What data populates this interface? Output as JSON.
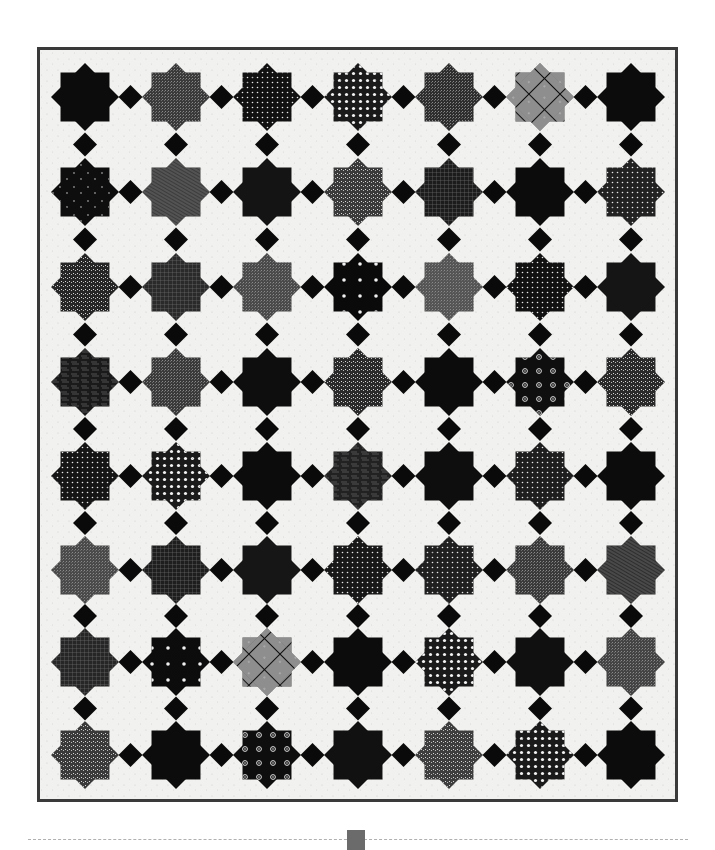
{
  "page": {
    "page_number_tab": ""
  },
  "quilt": {
    "columns": 7,
    "rows": 8,
    "background_color": "#f1f1ef",
    "border_color": "#3a3a3a",
    "connector_color": "#0a0a0a",
    "col_centers": [
      85,
      176,
      267,
      358,
      449,
      540,
      631
    ],
    "row_centers": [
      97,
      192,
      287,
      382,
      476,
      570,
      662,
      755
    ],
    "star_size": 68,
    "stars": [
      [
        {
          "tone": "#0c0c0c",
          "pattern": "solid"
        },
        {
          "tone": "#3a3a3a",
          "pattern": "texture"
        },
        {
          "tone": "#111111",
          "pattern": "dots"
        },
        {
          "tone": "#1a1a1a",
          "pattern": "flowers-light"
        },
        {
          "tone": "#2e2e2e",
          "pattern": "texture"
        },
        {
          "tone": "#7a7a7a",
          "pattern": "plaid"
        },
        {
          "tone": "#0c0c0c",
          "pattern": "solid"
        }
      ],
      [
        {
          "tone": "#0e0e0e",
          "pattern": "stars-sparse"
        },
        {
          "tone": "#3c3c3c",
          "pattern": "lines"
        },
        {
          "tone": "#141414",
          "pattern": "solid"
        },
        {
          "tone": "#3a3a3a",
          "pattern": "speckle"
        },
        {
          "tone": "#1c1c1c",
          "pattern": "grid"
        },
        {
          "tone": "#0c0c0c",
          "pattern": "solid"
        },
        {
          "tone": "#222222",
          "pattern": "dots"
        }
      ],
      [
        {
          "tone": "#262626",
          "pattern": "speckle"
        },
        {
          "tone": "#2a2a2a",
          "pattern": "grid"
        },
        {
          "tone": "#4a4a4a",
          "pattern": "texture"
        },
        {
          "tone": "#0a0a0a",
          "pattern": "dots-large"
        },
        {
          "tone": "#555555",
          "pattern": "texture"
        },
        {
          "tone": "#111111",
          "pattern": "dots"
        },
        {
          "tone": "#151515",
          "pattern": "solid"
        }
      ],
      [
        {
          "tone": "#1a1a1a",
          "pattern": "print"
        },
        {
          "tone": "#3a3a3a",
          "pattern": "texture"
        },
        {
          "tone": "#0e0e0e",
          "pattern": "solid"
        },
        {
          "tone": "#2a2a2a",
          "pattern": "speckle"
        },
        {
          "tone": "#0c0c0c",
          "pattern": "solid"
        },
        {
          "tone": "#0f0f0f",
          "pattern": "flowers"
        },
        {
          "tone": "#2a2a2a",
          "pattern": "speckle"
        }
      ],
      [
        {
          "tone": "#151515",
          "pattern": "dots"
        },
        {
          "tone": "#1a1a1a",
          "pattern": "flowers-light"
        },
        {
          "tone": "#0c0c0c",
          "pattern": "solid"
        },
        {
          "tone": "#222222",
          "pattern": "print"
        },
        {
          "tone": "#0e0e0e",
          "pattern": "solid"
        },
        {
          "tone": "#1e1e1e",
          "pattern": "dots"
        },
        {
          "tone": "#0c0c0c",
          "pattern": "solid"
        }
      ],
      [
        {
          "tone": "#4a4a4a",
          "pattern": "texture"
        },
        {
          "tone": "#1e1e1e",
          "pattern": "grid"
        },
        {
          "tone": "#161616",
          "pattern": "solid"
        },
        {
          "tone": "#181818",
          "pattern": "dots"
        },
        {
          "tone": "#202020",
          "pattern": "dots"
        },
        {
          "tone": "#3a3a3a",
          "pattern": "texture"
        },
        {
          "tone": "#2e2e2e",
          "pattern": "lines"
        }
      ],
      [
        {
          "tone": "#262626",
          "pattern": "grid"
        },
        {
          "tone": "#0c0c0c",
          "pattern": "dots-large"
        },
        {
          "tone": "#6a6a6a",
          "pattern": "plaid"
        },
        {
          "tone": "#0c0c0c",
          "pattern": "solid"
        },
        {
          "tone": "#1a1a1a",
          "pattern": "flowers-light"
        },
        {
          "tone": "#101010",
          "pattern": "solid"
        },
        {
          "tone": "#444444",
          "pattern": "texture"
        }
      ],
      [
        {
          "tone": "#3a3a3a",
          "pattern": "speckle"
        },
        {
          "tone": "#0c0c0c",
          "pattern": "solid"
        },
        {
          "tone": "#0e0e0e",
          "pattern": "flowers"
        },
        {
          "tone": "#111111",
          "pattern": "solid"
        },
        {
          "tone": "#3e3e3e",
          "pattern": "speckle"
        },
        {
          "tone": "#1a1a1a",
          "pattern": "flowers-light"
        },
        {
          "tone": "#0c0c0c",
          "pattern": "solid"
        }
      ]
    ]
  },
  "footer": {
    "rule_style": "dashed",
    "tab_color": "#6b6b6b"
  }
}
